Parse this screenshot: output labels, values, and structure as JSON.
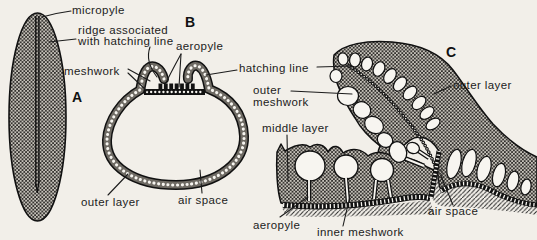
{
  "figure": {
    "panels": [
      {
        "id": "A",
        "label": "A"
      },
      {
        "id": "B",
        "label": "B"
      },
      {
        "id": "C",
        "label": "C"
      }
    ],
    "labels": {
      "micropyle": "micropyle",
      "ridge_line1": "ridge associated",
      "ridge_line2": "with hatching line",
      "meshwork": "meshwork",
      "aeropyle_b": "aeropyle",
      "hatching_line": "hatching line",
      "outer_meshwork_line1": "outer",
      "outer_meshwork_line2": "meshwork",
      "middle_layer": "middle layer",
      "outer_layer_b": "outer layer",
      "air_space_b": "air space",
      "outer_layer_c": "outer layer",
      "aeropyle_c": "aeropyle",
      "inner_meshwork": "inner meshwork",
      "air_space_c": "air space"
    },
    "colors": {
      "background": "#f2efe9",
      "ink": "#1c1c1c",
      "stipple_base": "#c6c2ba",
      "white_fill": "#f7f5f0"
    }
  }
}
